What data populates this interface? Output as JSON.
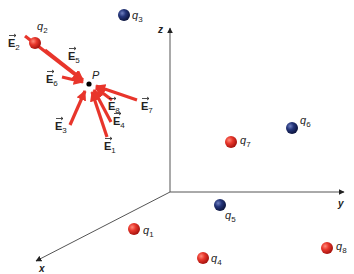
{
  "diagram": {
    "point": {
      "label": "P",
      "x": 89,
      "y": 84
    },
    "axes": {
      "origin": {
        "x": 170,
        "y": 192
      },
      "x": {
        "label": "x",
        "end": {
          "x": 34,
          "y": 262
        }
      },
      "y": {
        "label": "y",
        "end": {
          "x": 344,
          "y": 192
        }
      },
      "z": {
        "label": "z",
        "end": {
          "x": 170,
          "y": 27
        }
      },
      "color": "#555555"
    },
    "colors": {
      "positive_charge": "#e02a22",
      "negative_charge": "#1f2f70",
      "field_vector": "#e8352b",
      "point": "#000000"
    },
    "charges": [
      {
        "name": "q1",
        "label": "q",
        "sub": "1",
        "sign": "positive",
        "x": 134,
        "y": 229
      },
      {
        "name": "q2",
        "label": "q",
        "sub": "2",
        "sign": "positive",
        "x": 35,
        "y": 43
      },
      {
        "name": "q3",
        "label": "q",
        "sub": "3",
        "sign": "negative",
        "x": 124,
        "y": 15
      },
      {
        "name": "q4",
        "label": "q",
        "sub": "4",
        "sign": "positive",
        "x": 203,
        "y": 258
      },
      {
        "name": "q5",
        "label": "q",
        "sub": "5",
        "sign": "negative",
        "x": 220,
        "y": 205
      },
      {
        "name": "q6",
        "label": "q",
        "sub": "6",
        "sign": "negative",
        "x": 292,
        "y": 128
      },
      {
        "name": "q7",
        "label": "q",
        "sub": "7",
        "sign": "positive",
        "x": 231,
        "y": 142
      },
      {
        "name": "q8",
        "label": "q",
        "sub": "8",
        "sign": "positive",
        "x": 327,
        "y": 248
      }
    ],
    "vectors": [
      {
        "name": "E1",
        "label": "E",
        "sub": "1",
        "from": {
          "x": 107,
          "y": 137
        },
        "label_pos": {
          "x": 104,
          "y": 150
        }
      },
      {
        "name": "E2",
        "label": "E",
        "sub": "2",
        "from": {
          "x": 25,
          "y": 36
        },
        "label_pos": {
          "x": 8,
          "y": 47
        }
      },
      {
        "name": "E3",
        "label": "E",
        "sub": "3",
        "from": {
          "x": 70,
          "y": 125
        },
        "label_pos": {
          "x": 55,
          "y": 130
        }
      },
      {
        "name": "E4",
        "label": "E",
        "sub": "4",
        "from": {
          "x": 111,
          "y": 122
        },
        "label_pos": {
          "x": 113,
          "y": 125
        }
      },
      {
        "name": "E5",
        "label": "E",
        "sub": "5",
        "from": {
          "x": 45,
          "y": 50
        },
        "label_pos": {
          "x": 68,
          "y": 60
        }
      },
      {
        "name": "E6",
        "label": "E",
        "sub": "6",
        "from": {
          "x": 62,
          "y": 77
        },
        "label_pos": {
          "x": 46,
          "y": 83
        }
      },
      {
        "name": "E7",
        "label": "E",
        "sub": "7",
        "from": {
          "x": 137,
          "y": 100
        },
        "label_pos": {
          "x": 141,
          "y": 110
        }
      },
      {
        "name": "E8",
        "label": "E",
        "sub": "8",
        "from": {
          "x": 112,
          "y": 100
        },
        "label_pos": {
          "x": 108,
          "y": 110
        }
      }
    ],
    "labels": {
      "P": "P",
      "x": "x",
      "y": "y",
      "z": "z",
      "q1": "q",
      "q1_sub": "1",
      "q2": "q",
      "q2_sub": "2",
      "q3": "q",
      "q3_sub": "3",
      "q4": "q",
      "q4_sub": "4",
      "q5": "q",
      "q5_sub": "5",
      "q6": "q",
      "q6_sub": "6",
      "q7": "q",
      "q7_sub": "7",
      "q8": "q",
      "q8_sub": "8",
      "E1": "E",
      "E1_sub": "1",
      "E2": "E",
      "E2_sub": "2",
      "E3": "E",
      "E3_sub": "3",
      "E4": "E",
      "E4_sub": "4",
      "E5": "E",
      "E5_sub": "5",
      "E6": "E",
      "E6_sub": "6",
      "E7": "E",
      "E7_sub": "7",
      "E8": "E",
      "E8_sub": "8"
    }
  }
}
